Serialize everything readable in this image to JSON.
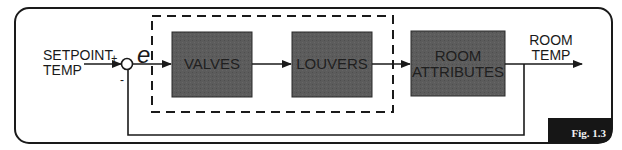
{
  "diagram": {
    "input_label_line1": "SETPOINT",
    "input_label_line2": "TEMP",
    "plus_sign": "+",
    "minus_sign": "-",
    "error_symbol": "e",
    "blocks": [
      {
        "label_line1": "VALVES",
        "label_line2": ""
      },
      {
        "label_line1": "LOUVERS",
        "label_line2": ""
      },
      {
        "label_line1": "ROOM",
        "label_line2": "ATTRIBUTES"
      }
    ],
    "output_label_line1": "ROOM",
    "output_label_line2": "TEMP",
    "figure_label": "Fig. 1.3",
    "colors": {
      "block_fill": "#5a5a5a",
      "line": "#1a1a1a",
      "badge": "#161616"
    }
  }
}
